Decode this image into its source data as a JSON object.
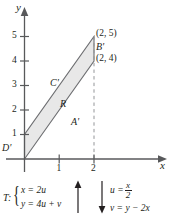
{
  "figure": {
    "axes": {
      "x_label": "x",
      "y_label": "y",
      "x_ticks": [
        "1",
        "2"
      ],
      "y_ticks": [
        "5",
        "4",
        "3",
        "2",
        "1"
      ],
      "x_range": [
        -0.35,
        2.9
      ],
      "y_range": [
        -0.5,
        5.7
      ]
    },
    "region": {
      "fill_color": "#e8e8e8",
      "edge_color": "#6d6e71",
      "label": "R",
      "vertices": [
        [
          0,
          0
        ],
        [
          2,
          4
        ],
        [
          2,
          5
        ],
        [
          0,
          1
        ]
      ],
      "edge_labels": {
        "bottom": "A'",
        "right": "B'",
        "top": "C'",
        "left": "D'"
      }
    },
    "point_labels": [
      {
        "text": "(2, 5)",
        "x": 2,
        "y": 5
      },
      {
        "text": "(2, 4)",
        "x": 2,
        "y": 4
      }
    ],
    "dashed_line": {
      "from": [
        2,
        0
      ],
      "to": [
        2,
        5
      ],
      "color": "#939598"
    }
  },
  "transformation": {
    "name": "T:",
    "forward": [
      "x = 2u",
      "y = 4u + v"
    ],
    "inverse_u_lhs": "u =",
    "inverse_u_num": "x",
    "inverse_u_den": "2",
    "inverse_v": "v = y − 2x",
    "arrow_up": "arrow-up-icon",
    "arrow_down": "arrow-down-icon"
  }
}
